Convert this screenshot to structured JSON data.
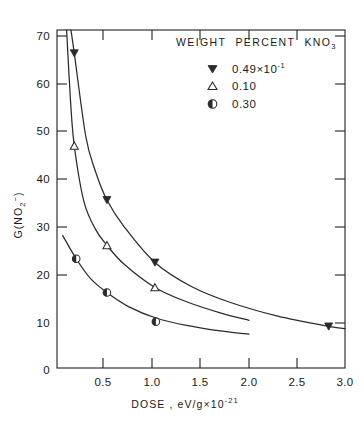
{
  "chart_data": {
    "type": "line",
    "title": "",
    "xlabel": "DOSE ,  eV/g×10⁻²¹",
    "ylabel": "G(NO₂⁻)",
    "xlim": [
      0,
      3.0
    ],
    "ylim": [
      0,
      73
    ],
    "grid": false,
    "legend_position": "top-right",
    "legend_title": "WEIGHT  PERCENT  KNO₃",
    "xticks": [
      0,
      0.5,
      1.0,
      1.5,
      2.0,
      2.5,
      3.0
    ],
    "xtick_labels": [
      "0",
      "0.5",
      "1.0",
      "1.5",
      "2.0",
      "2.5",
      "3.0"
    ],
    "yticks": [
      10,
      20,
      30,
      40,
      50,
      60,
      70
    ],
    "ytick_labels": [
      "10",
      "20",
      "30",
      "40",
      "50",
      "60",
      "70"
    ],
    "series": [
      {
        "name": "0.49×10⁻¹",
        "marker": "filled-down-triangle",
        "points": [
          {
            "x": 0.18,
            "y": 68.0
          },
          {
            "x": 0.52,
            "y": 36.3
          },
          {
            "x": 1.02,
            "y": 22.8
          },
          {
            "x": 2.83,
            "y": 9.0
          }
        ],
        "curve": [
          {
            "x": 0.145,
            "y": 73.0
          },
          {
            "x": 0.18,
            "y": 68.0
          },
          {
            "x": 0.3,
            "y": 50.0
          },
          {
            "x": 0.4,
            "y": 42.5
          },
          {
            "x": 0.52,
            "y": 36.3
          },
          {
            "x": 0.7,
            "y": 30.5
          },
          {
            "x": 1.02,
            "y": 22.8
          },
          {
            "x": 1.4,
            "y": 17.6
          },
          {
            "x": 1.8,
            "y": 14.2
          },
          {
            "x": 2.3,
            "y": 11.2
          },
          {
            "x": 2.83,
            "y": 9.0
          },
          {
            "x": 3.0,
            "y": 8.5
          }
        ]
      },
      {
        "name": "0.10",
        "marker": "open-up-triangle",
        "points": [
          {
            "x": 0.18,
            "y": 48.0
          },
          {
            "x": 0.52,
            "y": 26.5
          },
          {
            "x": 1.02,
            "y": 17.4
          }
        ],
        "curve": [
          {
            "x": 0.1,
            "y": 73.0
          },
          {
            "x": 0.14,
            "y": 58.0
          },
          {
            "x": 0.18,
            "y": 48.0
          },
          {
            "x": 0.28,
            "y": 36.0
          },
          {
            "x": 0.4,
            "y": 30.0
          },
          {
            "x": 0.52,
            "y": 26.5
          },
          {
            "x": 0.7,
            "y": 22.4
          },
          {
            "x": 1.02,
            "y": 17.4
          },
          {
            "x": 1.35,
            "y": 14.3
          },
          {
            "x": 1.7,
            "y": 11.9
          },
          {
            "x": 2.0,
            "y": 10.3
          }
        ]
      },
      {
        "name": "0.30",
        "marker": "half-filled-circle",
        "points": [
          {
            "x": 0.2,
            "y": 23.6
          },
          {
            "x": 0.52,
            "y": 16.3
          },
          {
            "x": 1.03,
            "y": 10.0
          }
        ],
        "curve": [
          {
            "x": 0.06,
            "y": 28.6
          },
          {
            "x": 0.2,
            "y": 23.6
          },
          {
            "x": 0.35,
            "y": 19.3
          },
          {
            "x": 0.52,
            "y": 16.3
          },
          {
            "x": 0.75,
            "y": 13.2
          },
          {
            "x": 1.03,
            "y": 10.8
          },
          {
            "x": 1.35,
            "y": 9.2
          },
          {
            "x": 1.7,
            "y": 8.0
          },
          {
            "x": 2.0,
            "y": 7.3
          }
        ]
      }
    ]
  },
  "axes": {
    "x_title_main": "DOSE ,  eV/g×10",
    "x_title_exp": "-21",
    "y_title_main_a": "G(NO",
    "y_title_sub": "2",
    "y_title_sup": "−",
    "y_title_main_b": ")"
  },
  "legend": {
    "title_parts": [
      "WEIGHT",
      "PERCENT",
      "KNO"
    ],
    "title_sub": "3",
    "entries": [
      {
        "label_main": "0.49×10",
        "label_exp": "-1",
        "marker": "filled-down-triangle"
      },
      {
        "label_main": "0.10",
        "label_exp": "",
        "marker": "open-up-triangle"
      },
      {
        "label_main": "0.30",
        "label_exp": "",
        "marker": "half-filled-circle"
      }
    ]
  },
  "colors": {
    "ink": "#2a2a2a",
    "background": "#ffffff"
  }
}
